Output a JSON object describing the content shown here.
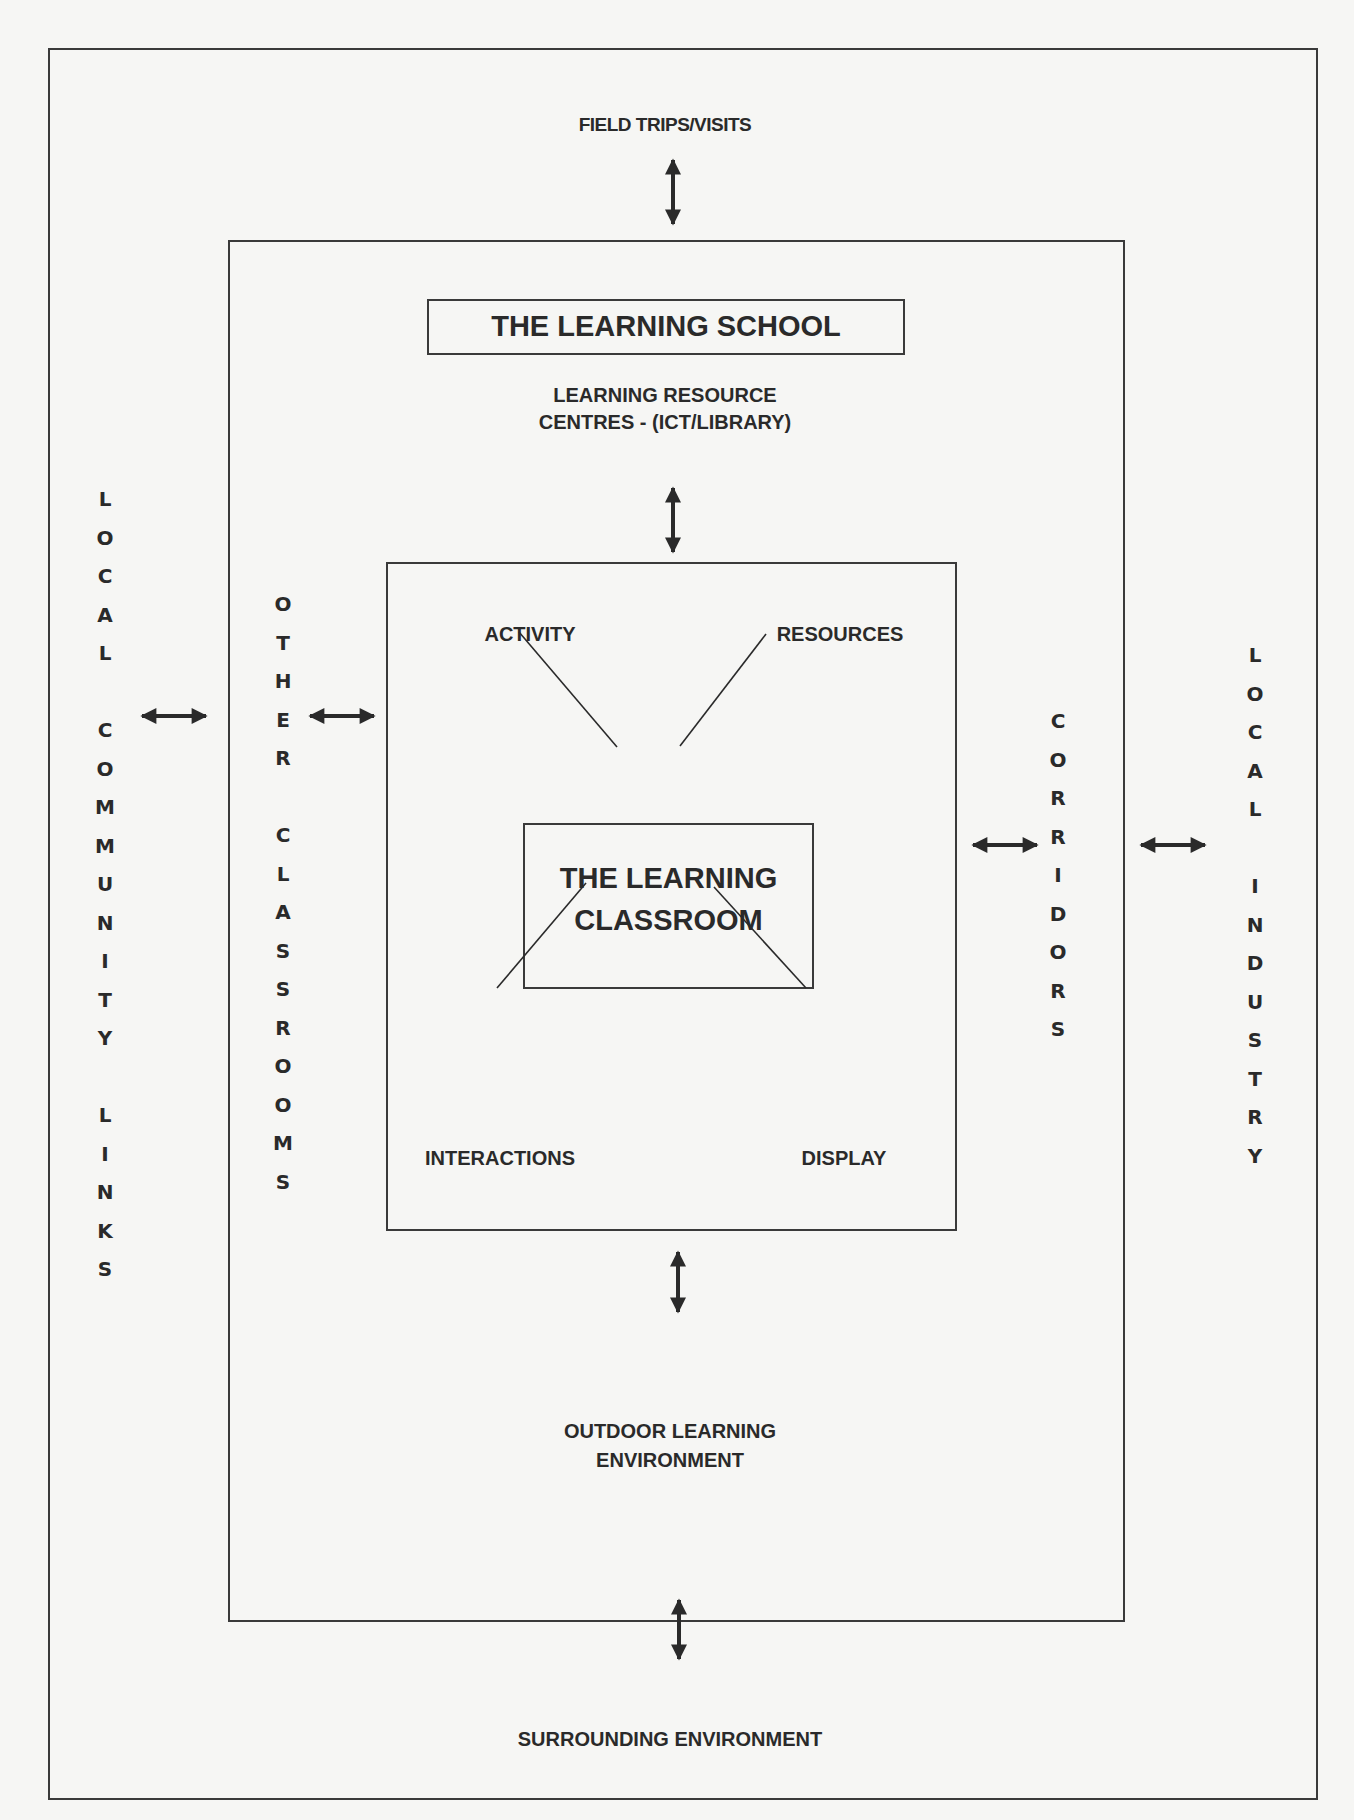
{
  "diagram": {
    "title": "THE LEARNING SCHOOL",
    "center": {
      "line1": "THE LEARNING",
      "line2": "CLASSROOM"
    },
    "top_outer": "FIELD TRIPS/VISITS",
    "resource_centres": {
      "line1": "LEARNING RESOURCE",
      "line2": "CENTRES - (ICT/LIBRARY)"
    },
    "classroom_elements": {
      "top_left": "ACTIVITY",
      "top_right": "RESOURCES",
      "bottom_left": "INTERACTIONS",
      "bottom_right": "DISPLAY"
    },
    "outdoor": {
      "line1": "OUTDOOR LEARNING",
      "line2": "ENVIRONMENT"
    },
    "bottom_outer": "SURROUNDING ENVIRONMENT",
    "left_outer_vertical": [
      "L",
      "O",
      "C",
      "A",
      "L",
      " ",
      "C",
      "O",
      "M",
      "M",
      "U",
      "N",
      "I",
      "T",
      "Y",
      " ",
      "L",
      "I",
      "N",
      "K",
      "S"
    ],
    "left_inner_vertical": [
      "O",
      "T",
      "H",
      "E",
      "R",
      " ",
      "C",
      "L",
      "A",
      "S",
      "S",
      "R",
      "O",
      "O",
      "M",
      "S"
    ],
    "right_inner_vertical": [
      "C",
      "O",
      "R",
      "R",
      "I",
      "D",
      "O",
      "R",
      "S"
    ],
    "right_outer_vertical": [
      "L",
      "O",
      "C",
      "A",
      "L",
      " ",
      "I",
      "N",
      "D",
      "U",
      "S",
      "T",
      "R",
      "Y"
    ],
    "arrows": [
      "bidirectional-vertical-top",
      "bidirectional-vertical-resource",
      "bidirectional-vertical-outdoor",
      "bidirectional-vertical-bottom",
      "bidirectional-horizontal-community",
      "bidirectional-horizontal-classrooms",
      "bidirectional-horizontal-corridors",
      "bidirectional-horizontal-industry"
    ],
    "colors": {
      "ink": "#2a2a2a",
      "paper": "#f6f6f4"
    }
  }
}
